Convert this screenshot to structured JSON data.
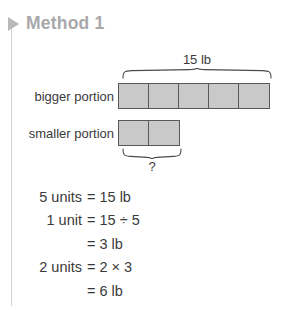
{
  "header": {
    "bullet_icon": "triangle-right-icon",
    "title": "Method 1"
  },
  "bar_model": {
    "total_label": "15 lb",
    "unknown_label": "?",
    "rows": [
      {
        "label": "bigger portion",
        "units": 5
      },
      {
        "label": "smaller portion",
        "units": 2
      }
    ],
    "colors": {
      "bar_fill": "#c9c9c9",
      "bar_stroke": "#595959",
      "text": "#3a3a3a"
    }
  },
  "equations": [
    {
      "lhs": "5 units",
      "rhs": "= 15 lb"
    },
    {
      "lhs": "1 unit",
      "rhs": "= 15 ÷ 5"
    },
    {
      "lhs": "",
      "rhs": "= 3 lb"
    },
    {
      "lhs": "2 units",
      "rhs": "= 2 × 3"
    },
    {
      "lhs": "",
      "rhs": "= 6 lb"
    }
  ]
}
